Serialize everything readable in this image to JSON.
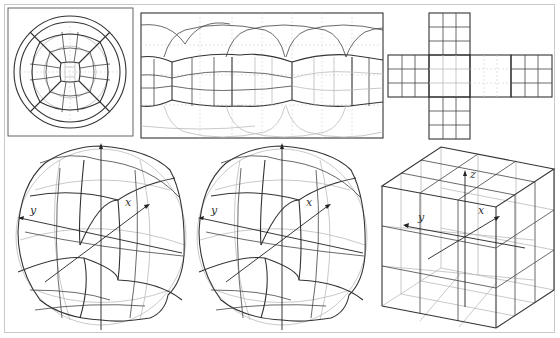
{
  "figure": {
    "panels": [
      {
        "id": "disk-projection",
        "description": "circular (azimuthal) projection of cube-sphere grid"
      },
      {
        "id": "equirectangular-projection",
        "description": "rectangular lat-lon projection of cube-sphere grid"
      },
      {
        "id": "cube-net",
        "description": "unfolded cube net, 3x3 grid per face"
      },
      {
        "id": "sphere-view-left",
        "description": "3D cube-sphere with axes"
      },
      {
        "id": "sphere-view-right",
        "description": "3D cube-sphere with axes (second view)"
      },
      {
        "id": "cube-view",
        "description": "3D cube with 3x3 subdivisions and axes"
      }
    ],
    "axis_labels": {
      "x": "x",
      "y": "y",
      "z": "z"
    },
    "colors": {
      "primary_line": "#333333",
      "secondary_line": "#bbbbbb",
      "frame": "#c8c8c8",
      "background": "#ffffff"
    }
  }
}
